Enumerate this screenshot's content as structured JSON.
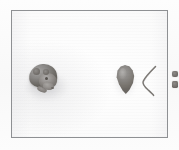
{
  "figure": {
    "caption": "",
    "background_color": "#fbfbfb",
    "plate_background_color": "#ffffff",
    "frame_color": "#8e9093",
    "specimen_color": "#8b8885",
    "shadow_color": "#c8c8cc"
  },
  "plate": {
    "frame": {
      "left_px": 11,
      "top_px": 10,
      "width_px": 157,
      "height_px": 128,
      "border_width_px": 1
    }
  },
  "specimens": [
    {
      "id": "whole-mouse",
      "label": "",
      "description": "intact mouse, head toward lower right, grey-brown fur with visible ear, eye and snout",
      "color": "#8c8a88",
      "position": {
        "left_px": 13,
        "top_px": 52,
        "width_px": 44,
        "height_px": 38
      }
    },
    {
      "id": "teardrop-specimen",
      "label": "",
      "description": "grey teardrop-shaped tissue, rounded top, pointed bottom",
      "color": "#8b8885",
      "position": {
        "left_px": 100,
        "top_px": 52,
        "width_px": 26,
        "height_px": 36
      }
    },
    {
      "id": "detached-tail",
      "label": "",
      "description": "thin curved tail forming an angular bracket shape",
      "color": "#6f6b67",
      "position": {
        "left_px": 128,
        "top_px": 54,
        "width_px": 22,
        "height_px": 32
      }
    },
    {
      "id": "detached-ears",
      "label": "",
      "description": "two small dark grey ear pieces stacked vertically at the right edge",
      "color": "#6f6b67",
      "count": 2,
      "position": {
        "left_px": 158,
        "top_px": 58,
        "width_px": 12,
        "height_px": 22
      }
    }
  ]
}
